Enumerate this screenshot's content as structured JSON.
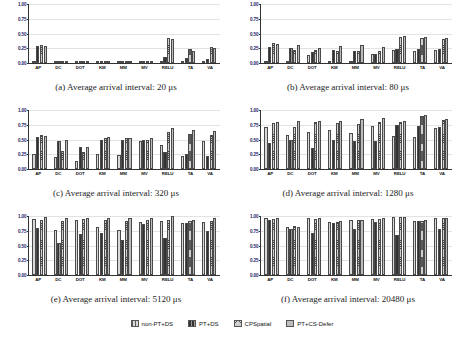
{
  "figure": {
    "categories": [
      "AP",
      "DC",
      "DOT",
      "KM",
      "MM",
      "MV",
      "RELU",
      "TA",
      "VA"
    ],
    "series_names": [
      "non-PT+DS",
      "PT+DS",
      "CPSpatial",
      "PT+CS-Defer"
    ],
    "yticks": [
      "0.00",
      "0.25",
      "0.50",
      "0.75",
      "1.00"
    ],
    "ylim": [
      0,
      1
    ]
  },
  "legend": {
    "items": [
      {
        "label": "non-PT+DS"
      },
      {
        "label": "PT+DS"
      },
      {
        "label": "CPSpatial"
      },
      {
        "label": "PT+CS-Defer"
      }
    ]
  },
  "chart_data": [
    {
      "type": "bar",
      "panel": "a",
      "title": "(a) Average arrival interval: 20 μs",
      "xlabel": "",
      "ylabel": "",
      "ylim": [
        0,
        1
      ],
      "grid": true,
      "legend_position": "bottom-shared",
      "categories": [
        "AP",
        "DC",
        "DOT",
        "KM",
        "MM",
        "MV",
        "RELU",
        "TA",
        "VA"
      ],
      "series": [
        {
          "name": "non-PT+DS",
          "values": [
            0.02,
            0.01,
            0.02,
            0.01,
            0.01,
            0.01,
            0.02,
            0.02,
            0.02
          ]
        },
        {
          "name": "PT+DS",
          "values": [
            0.28,
            0.01,
            0.03,
            0.01,
            0.01,
            0.03,
            0.11,
            0.08,
            0.06
          ]
        },
        {
          "name": "CPSpatial",
          "values": [
            0.3,
            0.02,
            0.04,
            0.01,
            0.01,
            0.04,
            0.42,
            0.23,
            0.27
          ]
        },
        {
          "name": "PT+CS-Defer",
          "values": [
            0.29,
            0.01,
            0.02,
            0.01,
            0.01,
            0.02,
            0.4,
            0.21,
            0.25
          ]
        }
      ]
    },
    {
      "type": "bar",
      "panel": "b",
      "title": "(b) Average arrival interval: 80 μs",
      "xlabel": "",
      "ylabel": "",
      "ylim": [
        0,
        1
      ],
      "grid": true,
      "legend_position": "bottom-shared",
      "categories": [
        "AP",
        "DC",
        "DOT",
        "KM",
        "MM",
        "MV",
        "RELU",
        "TA",
        "VA"
      ],
      "series": [
        {
          "name": "non-PT+DS",
          "values": [
            0.04,
            0.03,
            0.13,
            0.04,
            0.03,
            0.15,
            0.22,
            0.2,
            0.22
          ]
        },
        {
          "name": "PT+DS",
          "values": [
            0.27,
            0.26,
            0.19,
            0.22,
            0.2,
            0.16,
            0.24,
            0.23,
            0.23
          ]
        },
        {
          "name": "CPSpatial",
          "values": [
            0.34,
            0.22,
            0.22,
            0.2,
            0.21,
            0.2,
            0.44,
            0.42,
            0.4
          ]
        },
        {
          "name": "PT+CS-Defer",
          "values": [
            0.33,
            0.3,
            0.25,
            0.29,
            0.3,
            0.27,
            0.46,
            0.44,
            0.43
          ]
        }
      ]
    },
    {
      "type": "bar",
      "panel": "c",
      "title": "(c) Average arrival interval: 320 μs",
      "xlabel": "",
      "ylabel": "",
      "ylim": [
        0,
        1
      ],
      "grid": true,
      "legend_position": "bottom-shared",
      "categories": [
        "AP",
        "DC",
        "DOT",
        "KM",
        "MM",
        "MV",
        "RELU",
        "TA",
        "VA"
      ],
      "series": [
        {
          "name": "non-PT+DS",
          "values": [
            0.26,
            0.21,
            0.14,
            0.25,
            0.24,
            0.47,
            0.4,
            0.22,
            0.48
          ]
        },
        {
          "name": "PT+DS",
          "values": [
            0.55,
            0.47,
            0.37,
            0.5,
            0.5,
            0.49,
            0.28,
            0.26,
            0.22
          ]
        },
        {
          "name": "CPSpatial",
          "values": [
            0.57,
            0.31,
            0.29,
            0.52,
            0.52,
            0.5,
            0.62,
            0.6,
            0.58
          ]
        },
        {
          "name": "PT+CS-Defer",
          "values": [
            0.56,
            0.49,
            0.38,
            0.55,
            0.53,
            0.52,
            0.69,
            0.66,
            0.64
          ]
        }
      ]
    },
    {
      "type": "bar",
      "panel": "d",
      "title": "(d) Average arrival interval: 1280 μs",
      "xlabel": "",
      "ylabel": "",
      "ylim": [
        0,
        1
      ],
      "grid": true,
      "legend_position": "bottom-shared",
      "categories": [
        "AP",
        "DC",
        "DOT",
        "KM",
        "MM",
        "MV",
        "RELU",
        "TA",
        "VA"
      ],
      "series": [
        {
          "name": "non-PT+DS",
          "values": [
            0.72,
            0.58,
            0.63,
            0.66,
            0.61,
            0.73,
            0.56,
            0.55,
            0.69
          ]
        },
        {
          "name": "PT+DS",
          "values": [
            0.44,
            0.5,
            0.36,
            0.49,
            0.48,
            0.47,
            0.74,
            0.73,
            0.72
          ]
        },
        {
          "name": "CPSpatial",
          "values": [
            0.78,
            0.71,
            0.79,
            0.78,
            0.77,
            0.8,
            0.8,
            0.9,
            0.83
          ]
        },
        {
          "name": "PT+CS-Defer",
          "values": [
            0.8,
            0.81,
            0.81,
            0.82,
            0.84,
            0.86,
            0.82,
            0.91,
            0.85
          ]
        }
      ]
    },
    {
      "type": "bar",
      "panel": "e",
      "title": "(e) Average arrival interval: 5120 μs",
      "xlabel": "",
      "ylabel": "",
      "ylim": [
        0,
        1
      ],
      "grid": true,
      "legend_position": "bottom-shared",
      "categories": [
        "AP",
        "DC",
        "DOT",
        "KM",
        "MM",
        "MV",
        "RELU",
        "TA",
        "VA"
      ],
      "series": [
        {
          "name": "non-PT+DS",
          "values": [
            0.95,
            0.76,
            0.93,
            0.82,
            0.76,
            0.9,
            0.92,
            0.89,
            0.9
          ]
        },
        {
          "name": "PT+DS",
          "values": [
            0.79,
            0.55,
            0.69,
            0.72,
            0.59,
            0.86,
            0.62,
            0.88,
            0.75
          ]
        },
        {
          "name": "CPSpatial",
          "values": [
            0.93,
            0.92,
            0.95,
            0.93,
            0.92,
            0.93,
            0.94,
            0.91,
            0.92
          ]
        },
        {
          "name": "PT+CS-Defer",
          "values": [
            0.99,
            0.97,
            0.97,
            0.97,
            0.97,
            0.96,
            1.0,
            0.93,
            0.97
          ]
        }
      ]
    },
    {
      "type": "bar",
      "panel": "f",
      "title": "(f) Average arrival interval: 20480 μs",
      "xlabel": "",
      "ylabel": "",
      "ylim": [
        0,
        1
      ],
      "grid": true,
      "legend_position": "bottom-shared",
      "categories": [
        "AP",
        "DC",
        "DOT",
        "KM",
        "MM",
        "MV",
        "RELU",
        "TA",
        "VA"
      ],
      "series": [
        {
          "name": "non-PT+DS",
          "values": [
            0.96,
            0.82,
            0.96,
            0.9,
            0.93,
            0.95,
            0.99,
            0.92,
            0.97
          ]
        },
        {
          "name": "PT+DS",
          "values": [
            0.93,
            0.78,
            0.71,
            0.88,
            0.78,
            0.9,
            0.67,
            0.91,
            0.78
          ]
        },
        {
          "name": "CPSpatial",
          "values": [
            0.95,
            0.83,
            0.95,
            0.9,
            0.93,
            0.95,
            0.98,
            0.92,
            0.96
          ]
        },
        {
          "name": "PT+CS-Defer",
          "values": [
            0.96,
            0.82,
            0.97,
            0.91,
            0.93,
            0.96,
            0.99,
            0.93,
            0.97
          ]
        }
      ]
    }
  ]
}
